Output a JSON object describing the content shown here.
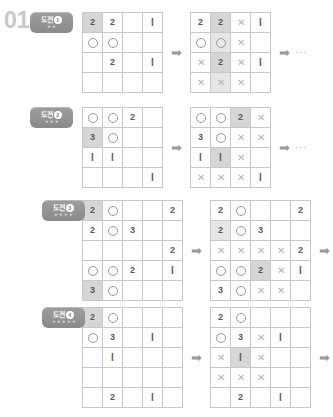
{
  "page": {
    "problem_number": "01",
    "arrow_glyph": "➡",
    "ellipsis": "···",
    "star_glyph": "★",
    "circle_symbol": "○",
    "cross_symbol": "✕",
    "colors": {
      "grid_line": "#c9c9c9",
      "shade_dark": "#d6d6d6",
      "shade_light": "#e6e6e6",
      "text": "#5a5a5a",
      "badge": "#8a8a8a",
      "problem_number": "#c8c8c8",
      "cross": "#b5b5b5"
    }
  },
  "sections": [
    {
      "badge": {
        "label": "도전",
        "number": "1",
        "stars": 2
      },
      "size": 4,
      "grid_before": [
        [
          {
            "v": "2",
            "s": "dark"
          },
          {
            "v": "2"
          },
          {
            "v": ""
          },
          {
            "v": "1"
          }
        ],
        [
          {
            "v": "○"
          },
          {
            "v": "○"
          },
          {
            "v": ""
          },
          {
            "v": ""
          }
        ],
        [
          {
            "v": ""
          },
          {
            "v": "2"
          },
          {
            "v": ""
          },
          {
            "v": "1"
          }
        ],
        [
          {
            "v": ""
          },
          {
            "v": ""
          },
          {
            "v": ""
          },
          {
            "v": ""
          }
        ]
      ],
      "grid_after": [
        [
          {
            "v": "2"
          },
          {
            "v": "2",
            "s": "dark"
          },
          {
            "v": "✕"
          },
          {
            "v": "1"
          }
        ],
        [
          {
            "v": "○"
          },
          {
            "v": "○",
            "s": "light"
          },
          {
            "v": "✕"
          },
          {
            "v": ""
          }
        ],
        [
          {
            "v": "✕"
          },
          {
            "v": "2",
            "s": "dark"
          },
          {
            "v": "✕"
          },
          {
            "v": "1"
          }
        ],
        [
          {
            "v": "✕"
          },
          {
            "v": "✕",
            "s": "light"
          },
          {
            "v": "✕"
          },
          {
            "v": ""
          }
        ]
      ]
    },
    {
      "badge": {
        "label": "도전",
        "number": "2",
        "stars": 3
      },
      "size": 4,
      "grid_before": [
        [
          {
            "v": "○"
          },
          {
            "v": "○"
          },
          {
            "v": "2"
          },
          {
            "v": ""
          }
        ],
        [
          {
            "v": "3",
            "s": "dark"
          },
          {
            "v": "○"
          },
          {
            "v": ""
          },
          {
            "v": ""
          }
        ],
        [
          {
            "v": "1"
          },
          {
            "v": "1"
          },
          {
            "v": ""
          },
          {
            "v": ""
          }
        ],
        [
          {
            "v": ""
          },
          {
            "v": ""
          },
          {
            "v": ""
          },
          {
            "v": "1"
          }
        ]
      ],
      "grid_after": [
        [
          {
            "v": "○"
          },
          {
            "v": "○"
          },
          {
            "v": "2",
            "s": "dark"
          },
          {
            "v": "✕"
          }
        ],
        [
          {
            "v": "3"
          },
          {
            "v": "○"
          },
          {
            "v": "✕"
          },
          {
            "v": "✕"
          }
        ],
        [
          {
            "v": "1"
          },
          {
            "v": "1",
            "s": "dark"
          },
          {
            "v": "✕"
          },
          {
            "v": ""
          }
        ],
        [
          {
            "v": "✕"
          },
          {
            "v": "✕"
          },
          {
            "v": "✕"
          },
          {
            "v": "1"
          }
        ]
      ]
    },
    {
      "badge": {
        "label": "도전",
        "number": "3",
        "stars": 4
      },
      "size": 5,
      "grid_before": [
        [
          {
            "v": "2",
            "s": "dark"
          },
          {
            "v": "○"
          },
          {
            "v": ""
          },
          {
            "v": ""
          },
          {
            "v": "2"
          }
        ],
        [
          {
            "v": "2"
          },
          {
            "v": "○"
          },
          {
            "v": "3"
          },
          {
            "v": ""
          },
          {
            "v": ""
          }
        ],
        [
          {
            "v": ""
          },
          {
            "v": ""
          },
          {
            "v": ""
          },
          {
            "v": ""
          },
          {
            "v": "2"
          }
        ],
        [
          {
            "v": "○"
          },
          {
            "v": "○"
          },
          {
            "v": "2"
          },
          {
            "v": ""
          },
          {
            "v": "1"
          }
        ],
        [
          {
            "v": "3",
            "s": "dark"
          },
          {
            "v": "○"
          },
          {
            "v": ""
          },
          {
            "v": ""
          },
          {
            "v": ""
          }
        ]
      ],
      "grid_after": [
        [
          {
            "v": "2"
          },
          {
            "v": "○"
          },
          {
            "v": ""
          },
          {
            "v": ""
          },
          {
            "v": "2"
          }
        ],
        [
          {
            "v": "2",
            "s": "light"
          },
          {
            "v": "○"
          },
          {
            "v": "3"
          },
          {
            "v": ""
          },
          {
            "v": ""
          }
        ],
        [
          {
            "v": "✕"
          },
          {
            "v": "✕"
          },
          {
            "v": "✕"
          },
          {
            "v": "✕"
          },
          {
            "v": "2"
          }
        ],
        [
          {
            "v": "○"
          },
          {
            "v": "○"
          },
          {
            "v": "2",
            "s": "dark"
          },
          {
            "v": "✕"
          },
          {
            "v": "1"
          }
        ],
        [
          {
            "v": "3"
          },
          {
            "v": "○"
          },
          {
            "v": "✕"
          },
          {
            "v": "✕"
          },
          {
            "v": ""
          }
        ]
      ]
    },
    {
      "badge": {
        "label": "도전",
        "number": "4",
        "stars": 5
      },
      "size": 5,
      "grid_before": [
        [
          {
            "v": "2",
            "s": "dark"
          },
          {
            "v": "○"
          },
          {
            "v": ""
          },
          {
            "v": ""
          },
          {
            "v": ""
          }
        ],
        [
          {
            "v": "○"
          },
          {
            "v": "3"
          },
          {
            "v": ""
          },
          {
            "v": "1"
          },
          {
            "v": ""
          }
        ],
        [
          {
            "v": ""
          },
          {
            "v": "1"
          },
          {
            "v": ""
          },
          {
            "v": ""
          },
          {
            "v": ""
          }
        ],
        [
          {
            "v": ""
          },
          {
            "v": ""
          },
          {
            "v": ""
          },
          {
            "v": ""
          },
          {
            "v": ""
          }
        ],
        [
          {
            "v": ""
          },
          {
            "v": "2"
          },
          {
            "v": ""
          },
          {
            "v": "1"
          },
          {
            "v": ""
          }
        ]
      ],
      "grid_after": [
        [
          {
            "v": "2"
          },
          {
            "v": "○"
          },
          {
            "v": ""
          },
          {
            "v": ""
          },
          {
            "v": ""
          }
        ],
        [
          {
            "v": "○"
          },
          {
            "v": "3"
          },
          {
            "v": "✕"
          },
          {
            "v": "1"
          },
          {
            "v": ""
          }
        ],
        [
          {
            "v": "✕"
          },
          {
            "v": "1",
            "s": "dark"
          },
          {
            "v": "✕"
          },
          {
            "v": ""
          },
          {
            "v": ""
          }
        ],
        [
          {
            "v": "✕"
          },
          {
            "v": "✕"
          },
          {
            "v": "✕"
          },
          {
            "v": ""
          },
          {
            "v": ""
          }
        ],
        [
          {
            "v": ""
          },
          {
            "v": "2"
          },
          {
            "v": ""
          },
          {
            "v": "1"
          },
          {
            "v": ""
          }
        ]
      ]
    }
  ]
}
